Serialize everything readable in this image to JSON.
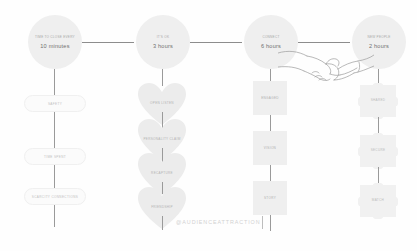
{
  "watermark": {
    "text": "@AUDIENCEATTRACTION"
  },
  "columns": [
    {
      "id": "column-1",
      "header": {
        "title": "TIME TO CLOSE EVERY",
        "value": "10 minutes"
      },
      "nodes": [
        {
          "label": "SAFETY",
          "shape": "pill"
        },
        {
          "label": "TIME SPENT",
          "shape": "pill"
        },
        {
          "label": "SCARCITY CONNECTIONS",
          "shape": "pill"
        }
      ]
    },
    {
      "id": "column-2",
      "header": {
        "title": "IT'S OK",
        "value": "3 hours"
      },
      "nodes": [
        {
          "label": "OPEN LISTEN",
          "shape": "heart"
        },
        {
          "label": "PERSONALITY CLAIM",
          "shape": "heart"
        },
        {
          "label": "RECAPTURE",
          "shape": "heart"
        },
        {
          "label": "FRIENDSHIP",
          "shape": "heart"
        }
      ]
    },
    {
      "id": "column-3",
      "header": {
        "title": "CONNECT",
        "value": "6 hours"
      },
      "nodes": [
        {
          "label": "ENGAGED",
          "shape": "square"
        },
        {
          "label": "VISION",
          "shape": "square"
        },
        {
          "label": "STORY",
          "shape": "square"
        }
      ]
    },
    {
      "id": "column-4",
      "header": {
        "title": "NEW PEOPLE",
        "value": "2 hours"
      },
      "nodes": [
        {
          "label": "SHARED",
          "shape": "puzzle"
        },
        {
          "label": "SECURE",
          "shape": "puzzle"
        },
        {
          "label": "MATCH",
          "shape": "puzzle"
        }
      ]
    }
  ],
  "illustration": {
    "name": "holding-hands-line-drawing"
  },
  "colors": {
    "background": "#fefefe",
    "node_fill": "#efefef",
    "connector": "#9a9a9a",
    "text_muted": "#b4b4b4",
    "watermark": "#d2d2d2"
  }
}
